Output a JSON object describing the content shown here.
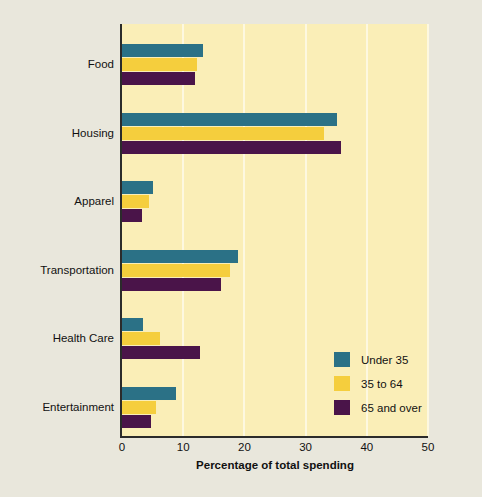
{
  "chart_data": {
    "type": "bar",
    "orientation": "horizontal",
    "title": "",
    "xlabel": "Percentage of total spending",
    "ylabel": "",
    "xlim": [
      0,
      50
    ],
    "xticks": [
      0,
      10,
      20,
      30,
      40,
      50
    ],
    "xtick_labels": [
      "0",
      "10",
      "20",
      "30",
      "40",
      "50"
    ],
    "grid": "vertical",
    "legend_position": "lower-right-inside",
    "categories": [
      "Food",
      "Housing",
      "Apparel",
      "Transportation",
      "Health Care",
      "Entertainment"
    ],
    "series": [
      {
        "name": "Under 35",
        "color": "#2b7186",
        "values": [
          13.3,
          35.2,
          5.0,
          19.0,
          3.4,
          8.8
        ]
      },
      {
        "name": "35 to 64",
        "color": "#f5ce3d",
        "values": [
          12.3,
          33.0,
          4.4,
          17.7,
          6.2,
          5.5
        ]
      },
      {
        "name": "65 and over",
        "color": "#4a1449",
        "values": [
          12.0,
          35.8,
          3.3,
          16.1,
          12.8,
          4.7
        ]
      }
    ]
  },
  "legend": {
    "items": [
      {
        "label": "Under 35",
        "color": "#2b7186"
      },
      {
        "label": "35 to 64",
        "color": "#f5ce3d"
      },
      {
        "label": "65 and over",
        "color": "#4a1449"
      }
    ]
  },
  "colors": {
    "figure_background": "#e9e7dc",
    "plot_background": "#faeeb7",
    "gridline": "#fdf8e0",
    "axis": "#2b2b2b",
    "text": "#111111"
  },
  "geometry": {
    "plot_left": 122,
    "plot_top": 24,
    "plot_width": 306,
    "plot_height": 412,
    "px_per_unit": 6.12,
    "bar_height": 13,
    "group_gap": 68.5,
    "group_start": 44
  }
}
